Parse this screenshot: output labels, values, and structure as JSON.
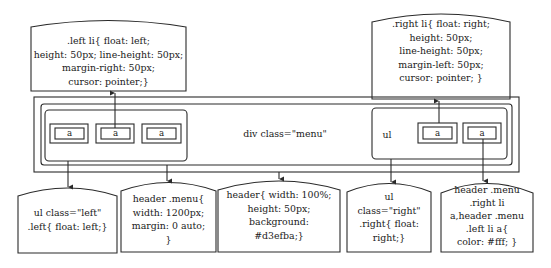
{
  "diagram": {
    "title_label": "div class=\"menu\"",
    "right_ul_label": "ul",
    "left_links": [
      "a",
      "a",
      "a"
    ],
    "right_links": [
      "a",
      "a"
    ],
    "top_callouts": {
      "left_li": [
        ".left li{ float: left;",
        "height: 50px; line-height: 50px;",
        "margin-right: 50px;",
        "cursor: pointer;}"
      ],
      "right_li": [
        ".right li{ float: right;",
        "height: 50px;",
        "line-height: 50px;",
        "margin-left: 50px;",
        "cursor: pointer; }"
      ]
    },
    "bottom_callouts": {
      "ul_left": [
        "ul class=\"left\"",
        ".left{ float: left;}"
      ],
      "menu": [
        "header .menu{",
        "width: 1200px;",
        "margin: 0 auto;",
        "}"
      ],
      "header": [
        "header{ width: 100%;",
        "height: 50px;",
        "background:",
        "#d3efba;}"
      ],
      "ul_right": [
        "ul",
        "class=\"right\"",
        ".right{ float:",
        "right;}"
      ],
      "link_color": [
        "header .menu",
        ".right li",
        "a,header .menu",
        ".left li a{",
        "color: #fff; }"
      ]
    }
  }
}
